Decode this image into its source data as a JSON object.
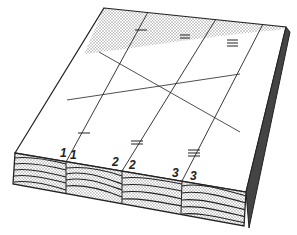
{
  "figure": {
    "type": "isometric-board-diagram",
    "colors": {
      "ink": "#222222",
      "shade": "#bdbdbd",
      "background": "#ffffff"
    }
  },
  "labels": [
    {
      "id": "label-1a",
      "text": "1",
      "x": 63,
      "y": 147
    },
    {
      "id": "label-1b",
      "text": "1",
      "x": 76,
      "y": 149
    },
    {
      "id": "label-2a",
      "text": "2",
      "x": 114,
      "y": 157
    },
    {
      "id": "label-2b",
      "text": "2",
      "x": 131,
      "y": 160
    },
    {
      "id": "label-3a",
      "text": "3",
      "x": 173,
      "y": 168
    },
    {
      "id": "label-3b",
      "text": "3",
      "x": 190,
      "y": 171
    }
  ],
  "marks": {
    "single_tick": "1",
    "double_tick": "2",
    "triple_tick": "3"
  }
}
